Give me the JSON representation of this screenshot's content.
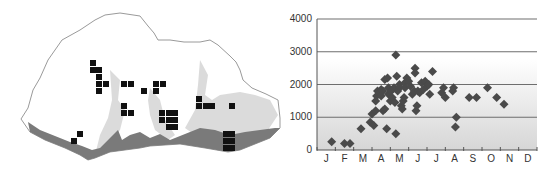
{
  "figure": {
    "left_panel": "Distribution map with elevation shading and occurrence grid squares",
    "right_panel": "Scatter of elevation (m) vs month"
  },
  "colors": {
    "map_border": "#9a9a9a",
    "lowland_shade": "#7a7a7a",
    "mid_shade": "#c4c4c4",
    "grid_square": "#111111",
    "marker": "#4a4a4a",
    "gridline": "#6e6e6e",
    "axis": "#555555"
  },
  "map": {
    "squares": [
      [
        93,
        63
      ],
      [
        93,
        70
      ],
      [
        99,
        70
      ],
      [
        99,
        77
      ],
      [
        99,
        84
      ],
      [
        106,
        84
      ],
      [
        99,
        91
      ],
      [
        124,
        84
      ],
      [
        131,
        84
      ],
      [
        144,
        91
      ],
      [
        156,
        84
      ],
      [
        163,
        84
      ],
      [
        156,
        91
      ],
      [
        124,
        106
      ],
      [
        124,
        113
      ],
      [
        131,
        113
      ],
      [
        162,
        113
      ],
      [
        169,
        113
      ],
      [
        175,
        113
      ],
      [
        162,
        120
      ],
      [
        169,
        120
      ],
      [
        175,
        120
      ],
      [
        169,
        127
      ],
      [
        175,
        127
      ],
      [
        199,
        99
      ],
      [
        199,
        106
      ],
      [
        206,
        106
      ],
      [
        212,
        106
      ],
      [
        232,
        106
      ],
      [
        226,
        134
      ],
      [
        232,
        134
      ],
      [
        226,
        141
      ],
      [
        232,
        141
      ],
      [
        226,
        148
      ],
      [
        232,
        148
      ],
      [
        80,
        134
      ],
      [
        74,
        141
      ]
    ]
  },
  "chart_data": {
    "type": "scatter",
    "title": "",
    "xlabel": "",
    "ylabel": "",
    "x_tick_labels": [
      "J",
      "F",
      "M",
      "A",
      "M",
      "J",
      "J",
      "A",
      "S",
      "O",
      "N",
      "D"
    ],
    "y_tick_labels": [
      "0",
      "1000",
      "2000",
      "3000",
      "4000"
    ],
    "ylim": [
      0,
      4000
    ],
    "xlim": [
      0.5,
      12.5
    ],
    "grid": "horizontal",
    "legend": null,
    "points": [
      {
        "x": 1.3,
        "y": 250
      },
      {
        "x": 2.0,
        "y": 200
      },
      {
        "x": 2.3,
        "y": 200
      },
      {
        "x": 2.9,
        "y": 650
      },
      {
        "x": 3.4,
        "y": 850
      },
      {
        "x": 3.5,
        "y": 1100
      },
      {
        "x": 3.6,
        "y": 750
      },
      {
        "x": 3.7,
        "y": 1200
      },
      {
        "x": 3.7,
        "y": 1500
      },
      {
        "x": 3.75,
        "y": 1650
      },
      {
        "x": 3.8,
        "y": 1800
      },
      {
        "x": 3.9,
        "y": 1750
      },
      {
        "x": 4.0,
        "y": 1850
      },
      {
        "x": 4.0,
        "y": 1650
      },
      {
        "x": 4.1,
        "y": 1800
      },
      {
        "x": 4.1,
        "y": 1200
      },
      {
        "x": 4.2,
        "y": 1250
      },
      {
        "x": 4.2,
        "y": 2150
      },
      {
        "x": 4.3,
        "y": 650
      },
      {
        "x": 4.35,
        "y": 2200
      },
      {
        "x": 4.4,
        "y": 1900
      },
      {
        "x": 4.4,
        "y": 1700
      },
      {
        "x": 4.5,
        "y": 1500
      },
      {
        "x": 4.55,
        "y": 1800
      },
      {
        "x": 4.6,
        "y": 1600
      },
      {
        "x": 4.7,
        "y": 1900
      },
      {
        "x": 4.75,
        "y": 1450
      },
      {
        "x": 4.8,
        "y": 2900
      },
      {
        "x": 4.8,
        "y": 500
      },
      {
        "x": 4.85,
        "y": 2250
      },
      {
        "x": 4.9,
        "y": 1800
      },
      {
        "x": 5.0,
        "y": 1900
      },
      {
        "x": 5.0,
        "y": 2000
      },
      {
        "x": 5.1,
        "y": 1350
      },
      {
        "x": 5.15,
        "y": 1250
      },
      {
        "x": 5.2,
        "y": 1500
      },
      {
        "x": 5.25,
        "y": 1600
      },
      {
        "x": 5.3,
        "y": 2050
      },
      {
        "x": 5.3,
        "y": 1900
      },
      {
        "x": 5.4,
        "y": 2200
      },
      {
        "x": 5.5,
        "y": 2100
      },
      {
        "x": 5.6,
        "y": 1950
      },
      {
        "x": 5.7,
        "y": 1700
      },
      {
        "x": 5.8,
        "y": 1800
      },
      {
        "x": 5.85,
        "y": 2500
      },
      {
        "x": 5.85,
        "y": 2350
      },
      {
        "x": 5.9,
        "y": 1200
      },
      {
        "x": 5.95,
        "y": 1350
      },
      {
        "x": 6.0,
        "y": 1800
      },
      {
        "x": 6.1,
        "y": 1750
      },
      {
        "x": 6.2,
        "y": 2050
      },
      {
        "x": 6.3,
        "y": 1850
      },
      {
        "x": 6.4,
        "y": 2100
      },
      {
        "x": 6.5,
        "y": 1950
      },
      {
        "x": 6.6,
        "y": 2000
      },
      {
        "x": 6.65,
        "y": 1700
      },
      {
        "x": 6.8,
        "y": 2400
      },
      {
        "x": 7.3,
        "y": 1750
      },
      {
        "x": 7.4,
        "y": 1900
      },
      {
        "x": 7.5,
        "y": 1600
      },
      {
        "x": 7.9,
        "y": 1800
      },
      {
        "x": 7.95,
        "y": 1900
      },
      {
        "x": 8.05,
        "y": 700
      },
      {
        "x": 8.1,
        "y": 1000
      },
      {
        "x": 8.8,
        "y": 1600
      },
      {
        "x": 9.2,
        "y": 1600
      },
      {
        "x": 9.8,
        "y": 1900
      },
      {
        "x": 10.3,
        "y": 1600
      },
      {
        "x": 10.7,
        "y": 1400
      }
    ]
  }
}
